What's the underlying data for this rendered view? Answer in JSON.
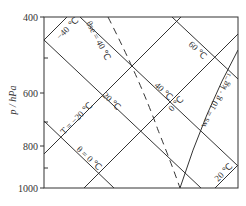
{
  "diagram": {
    "type": "skew-T thermodynamic diagram (T-lnp)",
    "y_axis": {
      "title": "p / hPa",
      "ticks": [
        "400",
        "600",
        "800",
        "1000"
      ],
      "minor_ticks": [
        "500",
        "700",
        "900"
      ],
      "range": [
        400,
        1000
      ]
    },
    "isotherms": [
      {
        "label": "-40 °C"
      },
      {
        "label": "T = -20 °C"
      },
      {
        "label": "0 °C"
      },
      {
        "label": "20 °C"
      }
    ],
    "dry_adiabats": [
      {
        "label": "θ = 0 °C"
      },
      {
        "label": "20 °C"
      },
      {
        "label": "40 °C"
      },
      {
        "label": "60 °C"
      }
    ],
    "moist_adiabat": {
      "label": "θse = 40 °C",
      "style": "dashed"
    },
    "mixing_ratio_line": {
      "label": "ws = 10 g · kg⁻¹",
      "style": "solid curve"
    },
    "colors": {
      "lines": "#333333",
      "background": "#ffffff"
    }
  },
  "labels": {
    "y_title": "p / hPa",
    "tick_400": "400",
    "tick_600": "600",
    "tick_800": "800",
    "tick_1000": "1000",
    "iso_m40": "−40 ℃",
    "iso_m20": "T = −20 ℃",
    "iso_0": "0 ℃",
    "iso_20": "20 ℃",
    "theta_0": "θ = 0 ℃",
    "theta_20": "20 ℃",
    "theta_40": "40 ℃",
    "theta_60": "60 ℃",
    "theta_se": "θse = 40 ℃",
    "ws": "ws = 10 g · kg⁻¹"
  }
}
